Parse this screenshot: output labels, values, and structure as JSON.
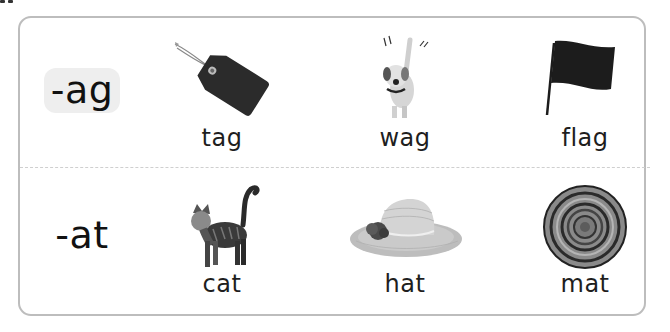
{
  "card": {
    "rows": [
      {
        "family": "-ag",
        "words": [
          {
            "label": "tag",
            "icon": "tag-icon"
          },
          {
            "label": "wag",
            "icon": "dog-wagging-icon"
          },
          {
            "label": "flag",
            "icon": "flag-icon"
          }
        ]
      },
      {
        "family": "-at",
        "words": [
          {
            "label": "cat",
            "icon": "cat-icon"
          },
          {
            "label": "hat",
            "icon": "hat-icon"
          },
          {
            "label": "mat",
            "icon": "round-mat-icon"
          }
        ]
      }
    ]
  },
  "colors": {
    "frame_border": "#bdbdbd",
    "family_pill": "#eeeeee",
    "divider": "#cfcfcf",
    "text": "#1a1a1a"
  }
}
